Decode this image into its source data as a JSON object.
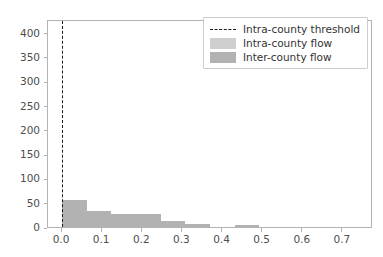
{
  "chart_data": {
    "type": "bar",
    "title": "",
    "xlabel": "",
    "ylabel": "",
    "xlim": [
      -0.035,
      0.775
    ],
    "ylim": [
      0,
      428
    ],
    "grid": false,
    "bin_width": 0.0615,
    "x": [
      0.0,
      0.0615,
      0.123,
      0.1845,
      0.246,
      0.3075,
      0.369,
      0.4305,
      0.492,
      0.5535,
      0.615,
      0.6765,
      0.738
    ],
    "bin_edges": [
      0.0,
      0.0615,
      0.123,
      0.1845,
      0.246,
      0.3075,
      0.369,
      0.4305,
      0.492,
      0.5535,
      0.615,
      0.6765,
      0.738,
      0.7995
    ],
    "values": [
      56,
      33,
      26,
      26,
      13,
      6,
      0,
      4,
      0,
      0,
      0,
      0,
      0
    ],
    "series": [
      {
        "name": "Inter-county flow",
        "color": "#b2b2b2",
        "values": [
          56,
          33,
          26,
          26,
          13,
          6,
          0,
          4,
          0,
          0,
          0,
          0,
          0
        ]
      }
    ],
    "annotations": [
      {
        "name": "intra-county-threshold",
        "type": "vline",
        "x": 0.0,
        "style": "dashed",
        "color": "#1a1a1a"
      }
    ],
    "xticks": [
      {
        "value": 0.0,
        "label": "0.0"
      },
      {
        "value": 0.1,
        "label": "0.1"
      },
      {
        "value": 0.2,
        "label": "0.2"
      },
      {
        "value": 0.3,
        "label": "0.3"
      },
      {
        "value": 0.4,
        "label": "0.4"
      },
      {
        "value": 0.5,
        "label": "0.5"
      },
      {
        "value": 0.6,
        "label": "0.6"
      },
      {
        "value": 0.7,
        "label": "0.7"
      }
    ],
    "yticks": [
      {
        "value": 0,
        "label": "0"
      },
      {
        "value": 50,
        "label": "50"
      },
      {
        "value": 100,
        "label": "100"
      },
      {
        "value": 150,
        "label": "150"
      },
      {
        "value": 200,
        "label": "200"
      },
      {
        "value": 250,
        "label": "250"
      },
      {
        "value": 300,
        "label": "300"
      },
      {
        "value": 350,
        "label": "350"
      },
      {
        "value": 400,
        "label": "400"
      }
    ],
    "legend": {
      "position": "upper right",
      "entries": [
        {
          "label": "Intra-county threshold",
          "key": "dashed-line",
          "color": "#1a1a1a"
        },
        {
          "label": "Intra-county flow",
          "key": "swatch-light",
          "color": "#cfcfcf"
        },
        {
          "label": "Inter-county flow",
          "key": "swatch-dark",
          "color": "#b2b2b2"
        }
      ]
    }
  }
}
